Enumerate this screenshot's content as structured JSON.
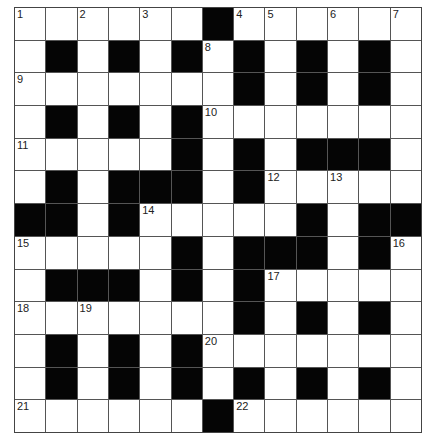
{
  "puzzle": {
    "rows": 13,
    "cols": 13,
    "colors": {
      "black": "#050505",
      "white": "#ffffff",
      "line": "#555555"
    },
    "layout": [
      "......#......",
      ".#.#.#.#.#.#.",
      ".......#.#.#.",
      ".#.#.#.......",
      ".....#.#.###.",
      ".#.###.#.....",
      "##.#.....#.##",
      ".....#.###.#.",
      ".###.#.#.....",
      ".......#.#.#.",
      ".#.#.#.......",
      ".#.#.#.#.#.#.",
      "......#......"
    ],
    "numbers": [
      {
        "r": 0,
        "c": 0,
        "n": "1"
      },
      {
        "r": 0,
        "c": 2,
        "n": "2"
      },
      {
        "r": 0,
        "c": 4,
        "n": "3"
      },
      {
        "r": 0,
        "c": 7,
        "n": "4"
      },
      {
        "r": 0,
        "c": 8,
        "n": "5"
      },
      {
        "r": 0,
        "c": 10,
        "n": "6"
      },
      {
        "r": 0,
        "c": 12,
        "n": "7"
      },
      {
        "r": 1,
        "c": 6,
        "n": "8"
      },
      {
        "r": 2,
        "c": 0,
        "n": "9"
      },
      {
        "r": 3,
        "c": 6,
        "n": "10"
      },
      {
        "r": 4,
        "c": 0,
        "n": "11"
      },
      {
        "r": 5,
        "c": 8,
        "n": "12"
      },
      {
        "r": 5,
        "c": 10,
        "n": "13"
      },
      {
        "r": 6,
        "c": 4,
        "n": "14"
      },
      {
        "r": 7,
        "c": 0,
        "n": "15"
      },
      {
        "r": 7,
        "c": 12,
        "n": "16"
      },
      {
        "r": 8,
        "c": 8,
        "n": "17"
      },
      {
        "r": 9,
        "c": 0,
        "n": "18"
      },
      {
        "r": 9,
        "c": 2,
        "n": "19"
      },
      {
        "r": 10,
        "c": 6,
        "n": "20"
      },
      {
        "r": 12,
        "c": 0,
        "n": "21"
      },
      {
        "r": 12,
        "c": 7,
        "n": "22"
      }
    ]
  }
}
